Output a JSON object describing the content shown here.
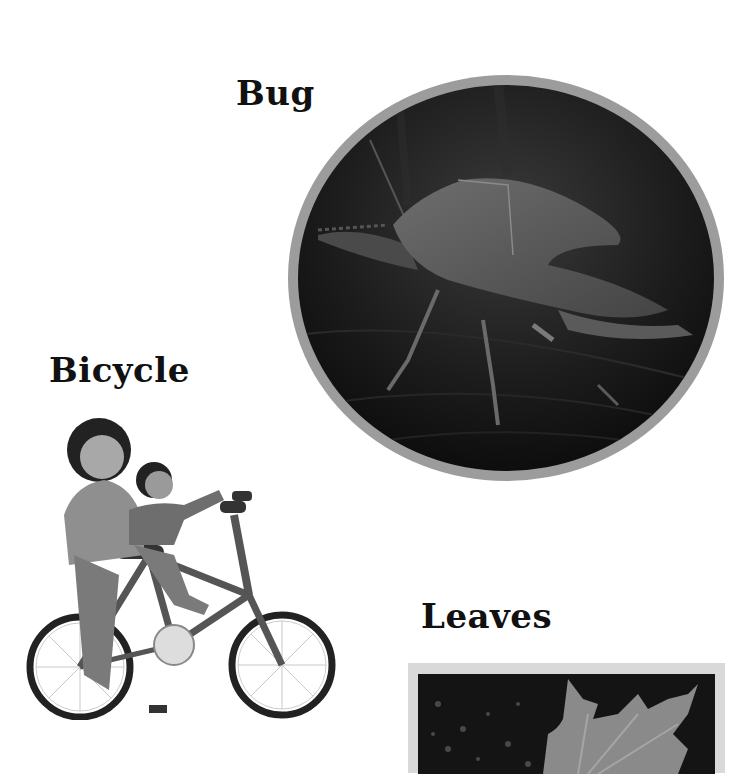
{
  "labels": {
    "bug": "Bug",
    "bicycle": "Bicycle",
    "leaves": "Leaves"
  },
  "images": {
    "bug": "photo of a stink bug on a leaf, oval frame",
    "bicycle": "illustration of a woman helping a child ride a bicycle",
    "leaves": "photo of a maple leaf on dark ground, square frame"
  },
  "colors": {
    "text": "#111111",
    "frame_gray": "#9c9c9c",
    "frame_light": "#d9d9d9",
    "photo_dark": "#141414"
  }
}
